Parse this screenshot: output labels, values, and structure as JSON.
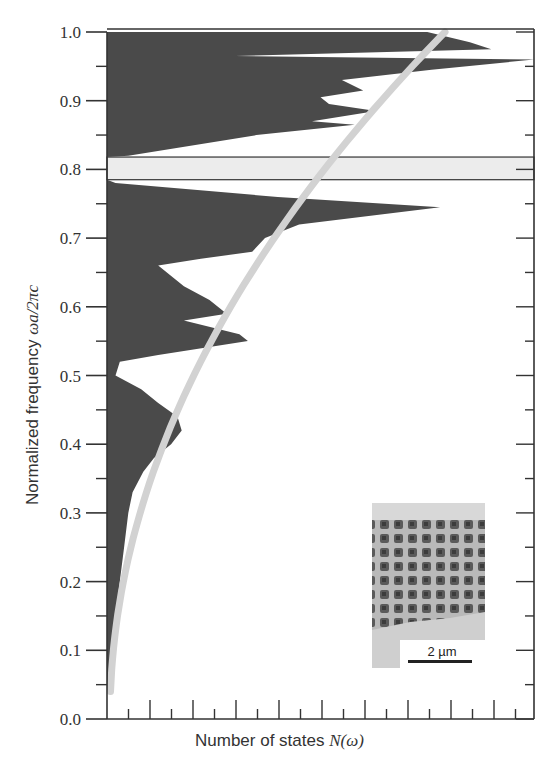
{
  "chart_data": {
    "type": "area",
    "title": "",
    "xlabel": "Number of states N(ω)",
    "xlabel_parts": {
      "text": "Number of states ",
      "math": "N(ω)"
    },
    "ylabel": "Normalized frequency ωa/2πc",
    "ylabel_parts": {
      "text": "Normalized frequency ",
      "math": "ωa/2πc"
    },
    "ylim": [
      0.0,
      1.0
    ],
    "y_ticks": [
      "0.0",
      "0.1",
      "0.2",
      "0.3",
      "0.4",
      "0.5",
      "0.6",
      "0.7",
      "0.8",
      "0.9",
      "1.0"
    ],
    "x_ticks_labeled": false,
    "x_minor_tick_count": 13,
    "band_gap": {
      "from": 0.785,
      "to": 0.818,
      "label": "photonic band gap"
    },
    "series": [
      {
        "name": "Density of states (photonic crystal)",
        "style": "filled",
        "color": "#4a4a4a",
        "points_freq_vs_relative_N": [
          [
            0.04,
            0.005
          ],
          [
            0.1,
            0.015
          ],
          [
            0.15,
            0.02
          ],
          [
            0.2,
            0.03
          ],
          [
            0.25,
            0.04
          ],
          [
            0.3,
            0.05
          ],
          [
            0.33,
            0.06
          ],
          [
            0.36,
            0.085
          ],
          [
            0.38,
            0.11
          ],
          [
            0.4,
            0.15
          ],
          [
            0.42,
            0.175
          ],
          [
            0.44,
            0.165
          ],
          [
            0.46,
            0.12
          ],
          [
            0.48,
            0.08
          ],
          [
            0.5,
            0.02
          ],
          [
            0.52,
            0.03
          ],
          [
            0.53,
            0.12
          ],
          [
            0.55,
            0.33
          ],
          [
            0.56,
            0.31
          ],
          [
            0.58,
            0.18
          ],
          [
            0.59,
            0.28
          ],
          [
            0.61,
            0.24
          ],
          [
            0.63,
            0.18
          ],
          [
            0.66,
            0.12
          ],
          [
            0.67,
            0.22
          ],
          [
            0.68,
            0.34
          ],
          [
            0.7,
            0.37
          ],
          [
            0.72,
            0.45
          ],
          [
            0.745,
            0.78
          ],
          [
            0.76,
            0.4
          ],
          [
            0.78,
            0.02
          ],
          [
            0.785,
            0.0
          ],
          [
            0.818,
            0.0
          ],
          [
            0.82,
            0.05
          ],
          [
            0.85,
            0.35
          ],
          [
            0.865,
            0.58
          ],
          [
            0.87,
            0.48
          ],
          [
            0.885,
            0.63
          ],
          [
            0.895,
            0.52
          ],
          [
            0.905,
            0.5
          ],
          [
            0.915,
            0.6
          ],
          [
            0.93,
            0.55
          ],
          [
            0.945,
            0.76
          ],
          [
            0.96,
            1.0
          ],
          [
            0.965,
            0.3
          ],
          [
            0.975,
            0.9
          ],
          [
            0.985,
            0.85
          ],
          [
            1.0,
            0.75
          ]
        ]
      },
      {
        "name": "Density of states (homogeneous medium)",
        "style": "line",
        "color": "#d3d3d3",
        "shape": "N proportional to ω^2"
      }
    ],
    "inset": {
      "description": "SEM image of woodpile photonic crystal",
      "scale_bar": "2 µm"
    },
    "grid": false,
    "legend": "none"
  }
}
